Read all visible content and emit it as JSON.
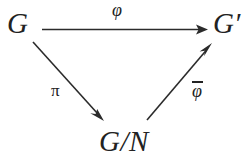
{
  "diagram": {
    "kind": "commutative-triangle",
    "background_color": "#ffffff",
    "ink_color": "#2b2b2b",
    "nodes": [
      {
        "id": "source",
        "label": "G",
        "position": "top-left"
      },
      {
        "id": "target",
        "label": "G′",
        "position": "top-right"
      },
      {
        "id": "quotient",
        "label_numerator": "G",
        "label_slash": "/",
        "label_denominator": "N",
        "label": "G/N",
        "position": "bottom-center"
      }
    ],
    "arrows": [
      {
        "id": "phi",
        "from": "source",
        "to": "target",
        "label": "φ",
        "label_position": "above",
        "overline": false,
        "style": "solid",
        "head": "filled-triangle"
      },
      {
        "id": "pi",
        "from": "source",
        "to": "quotient",
        "label": "π",
        "label_position": "left",
        "overline": false,
        "style": "solid",
        "head": "filled-triangle"
      },
      {
        "id": "phibar",
        "from": "quotient",
        "to": "target",
        "label": "φ",
        "label_position": "right",
        "overline": true,
        "style": "solid",
        "head": "filled-triangle"
      }
    ]
  },
  "nodes": {
    "source": "G",
    "target": "G′",
    "quotient_numerator": "G",
    "quotient_slash": "/",
    "quotient_denominator": "N"
  },
  "labels": {
    "phi": "φ",
    "pi": "π",
    "phibar": "φ"
  }
}
